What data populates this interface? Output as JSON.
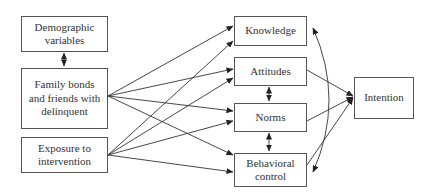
{
  "diagram": {
    "type": "path-model",
    "nodes": {
      "demographic": {
        "label": "Demographic variables"
      },
      "family": {
        "label": "Family bonds and friends with delinquent"
      },
      "exposure": {
        "label": "Exposure to intervention"
      },
      "knowledge": {
        "label": "Knowledge"
      },
      "attitudes": {
        "label": "Attitudes"
      },
      "norms": {
        "label": "Norms"
      },
      "behavioral": {
        "label": "Behavioral control"
      },
      "intention": {
        "label": "Intention"
      }
    },
    "edges": [
      {
        "from": "demographic",
        "to": "family",
        "type": "bidirectional"
      },
      {
        "from": "family",
        "to": "knowledge",
        "type": "directed"
      },
      {
        "from": "family",
        "to": "attitudes",
        "type": "directed"
      },
      {
        "from": "family",
        "to": "norms",
        "type": "directed"
      },
      {
        "from": "family",
        "to": "behavioral",
        "type": "directed"
      },
      {
        "from": "exposure",
        "to": "knowledge",
        "type": "directed"
      },
      {
        "from": "exposure",
        "to": "attitudes",
        "type": "directed"
      },
      {
        "from": "exposure",
        "to": "norms",
        "type": "directed"
      },
      {
        "from": "exposure",
        "to": "behavioral",
        "type": "directed"
      },
      {
        "from": "attitudes",
        "to": "norms",
        "type": "bidirectional"
      },
      {
        "from": "norms",
        "to": "behavioral",
        "type": "bidirectional"
      },
      {
        "from": "knowledge",
        "to": "behavioral",
        "type": "bidirectional-curved"
      },
      {
        "from": "attitudes",
        "to": "intention",
        "type": "directed"
      },
      {
        "from": "norms",
        "to": "intention",
        "type": "directed"
      },
      {
        "from": "behavioral",
        "to": "intention",
        "type": "directed"
      }
    ]
  }
}
